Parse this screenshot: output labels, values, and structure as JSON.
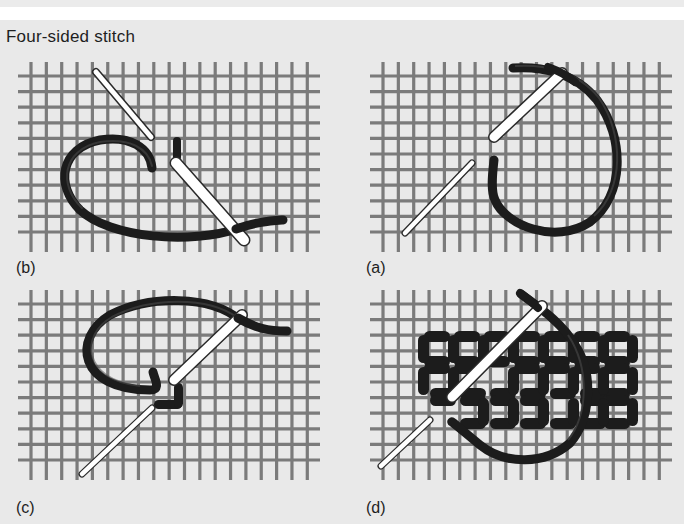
{
  "title": "Four-sided stitch",
  "panels": [
    {
      "id": "b",
      "label": "(b)",
      "position": "top-left",
      "description": "Needle passes diagonally under canvas; first vertical stitch made, thread looped left"
    },
    {
      "id": "a",
      "label": "(a)",
      "position": "top-right",
      "description": "Needle inserted diagonally, thread loops around to the right"
    },
    {
      "id": "c",
      "label": "(c)",
      "position": "bottom-left",
      "description": "Vertical and horizontal stitches form corner; needle emerges top-right"
    },
    {
      "id": "d",
      "label": "(d)",
      "position": "bottom-right",
      "description": "Completed rows of four-sided stitch blocks with needle and thread"
    }
  ],
  "colors": {
    "background": "#e9e9e9",
    "grid": "#7b7b7b",
    "thread": "#1c1c1c",
    "thread_highlight": "#555555",
    "needle": "#ffffff",
    "needle_outline": "#2a2a2a",
    "text": "#1e1e1e"
  }
}
